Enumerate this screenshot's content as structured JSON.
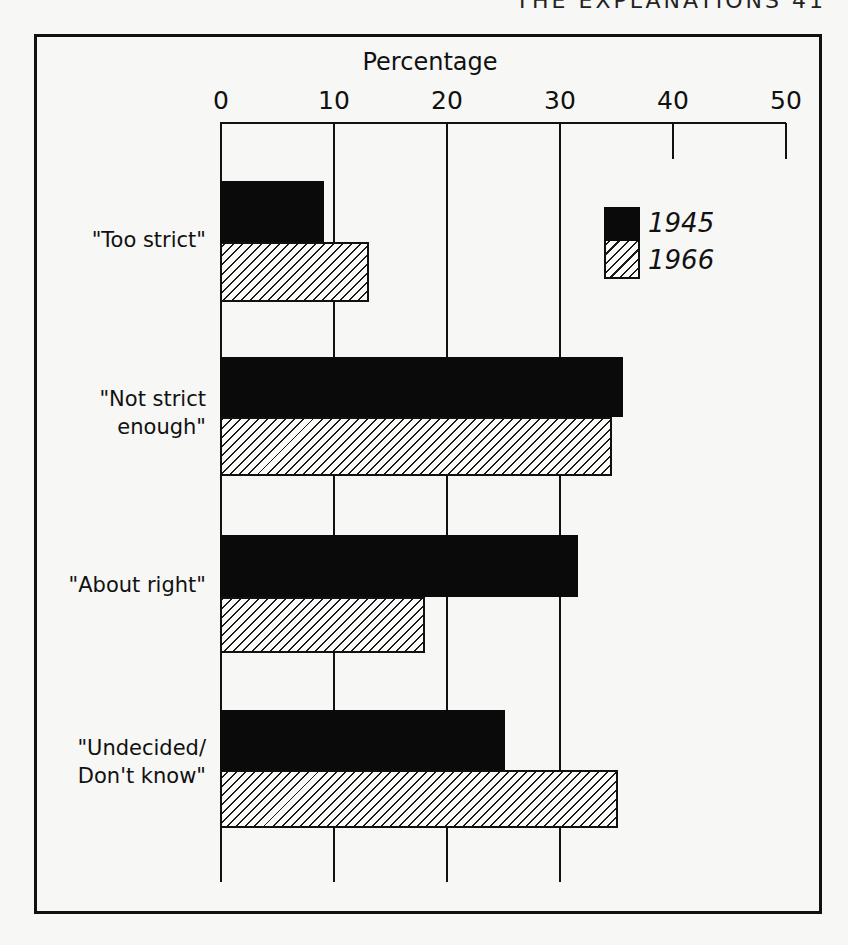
{
  "page": {
    "running_head": "THE EXPLANATIONS   41"
  },
  "chart_data": {
    "type": "bar",
    "orientation": "horizontal",
    "title": "",
    "xlabel": "Percentage",
    "ylabel": "",
    "xlim": [
      0,
      50
    ],
    "x_ticks": [
      0,
      10,
      20,
      30,
      40,
      50
    ],
    "x_tick_labels": [
      "0",
      "10",
      "20",
      "30",
      "40",
      "50"
    ],
    "grid": true,
    "legend_position": "upper right (inside)",
    "categories": [
      "\"Too strict\"",
      "\"Not strict enough\"",
      "\"About right\"",
      "\"Undecided/ Don't know\""
    ],
    "category_lines": [
      [
        "\"Too strict\""
      ],
      [
        "\"Not strict",
        "enough\""
      ],
      [
        "\"About right\""
      ],
      [
        "\"Undecided/",
        "Don't know\""
      ]
    ],
    "series": [
      {
        "name": "1945",
        "style": "solid black",
        "values": [
          9,
          35.5,
          31.5,
          25
        ]
      },
      {
        "name": "1966",
        "style": "diagonal hatch",
        "values": [
          13,
          34.5,
          18,
          35
        ]
      }
    ]
  },
  "legend": {
    "items": [
      {
        "label": "1945",
        "swatch": "solid-black"
      },
      {
        "label": "1966",
        "swatch": "hatched"
      }
    ]
  },
  "colors": {
    "ink": "#111111",
    "paper": "#f7f7f5"
  }
}
